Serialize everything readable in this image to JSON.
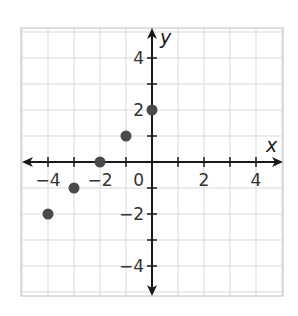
{
  "chart_data": {
    "type": "scatter",
    "title": "",
    "xlabel": "x",
    "ylabel": "y",
    "xlim": [
      -5,
      5
    ],
    "ylim": [
      -5,
      5
    ],
    "grid": true,
    "grid_step": 1,
    "x_ticks": [
      -4,
      -3,
      -2,
      -1,
      1,
      2,
      3,
      4
    ],
    "y_ticks": [
      -4,
      -3,
      -2,
      -1,
      1,
      2,
      3,
      4
    ],
    "x_tick_labels": [
      {
        "value": -4,
        "text": "−4"
      },
      {
        "value": -2,
        "text": "−2"
      },
      {
        "value": 2,
        "text": "2"
      },
      {
        "value": 4,
        "text": "4"
      }
    ],
    "y_tick_labels": [
      {
        "value": 4,
        "text": "4"
      },
      {
        "value": 2,
        "text": "2"
      },
      {
        "value": -2,
        "text": "−2"
      },
      {
        "value": -4,
        "text": "−4"
      }
    ],
    "origin_label": "0",
    "series": [
      {
        "name": "points",
        "color": "#4a4a4a",
        "points": [
          {
            "x": -4,
            "y": -2
          },
          {
            "x": -3,
            "y": -1
          },
          {
            "x": -2,
            "y": 0
          },
          {
            "x": -1,
            "y": 1
          },
          {
            "x": 0,
            "y": 2
          }
        ]
      }
    ]
  }
}
